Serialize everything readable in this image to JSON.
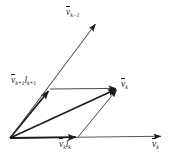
{
  "figure": {
    "type": "vector-diagram",
    "background_color": "#ffffff",
    "stroke_color": "#1a1a1a",
    "width": 173,
    "height": 159
  },
  "labels": {
    "v_k_minus_1": {
      "symbol": "v",
      "sub": "k−1",
      "text": "v̅"
    },
    "v_k_plus_1_l_k_plus_1": {
      "symbol": "v",
      "sub": "k+1",
      "l_symbol": "l",
      "l_sub": "k+1"
    },
    "v_k_diagonal": {
      "symbol": "v",
      "sub": "k"
    },
    "v_k_l_k": {
      "symbol": "v",
      "sub": "k",
      "l_symbol": "l",
      "l_sub": "k"
    },
    "v_k_axis": {
      "symbol": "v",
      "sub": "k"
    }
  },
  "vectors": {
    "origin": {
      "x": 10,
      "y": 138
    },
    "axis_horizontal": {
      "name": "v-k-axis-arrow",
      "to": {
        "x": 163,
        "y": 136
      }
    },
    "v_k_l_k": {
      "name": "v-k-l-k-arrow",
      "to": {
        "x": 78,
        "y": 137
      }
    },
    "v_k_plus_1_l_k_plus_1": {
      "name": "v-k-plus-1-l-k-plus-1-arrow",
      "to": {
        "x": 50,
        "y": 89
      }
    },
    "v_k_minus_1": {
      "name": "v-k-minus-1-arrow",
      "to": {
        "x": 97,
        "y": 22
      }
    },
    "v_k_resultant": {
      "name": "v-k-resultant-arrow",
      "to": {
        "x": 118,
        "y": 88
      }
    }
  },
  "parallelogram": {
    "side_top": {
      "from": {
        "x": 50,
        "y": 89
      },
      "to": {
        "x": 118,
        "y": 88
      }
    },
    "side_right": {
      "from": {
        "x": 78,
        "y": 137
      },
      "to": {
        "x": 118,
        "y": 88
      }
    }
  }
}
